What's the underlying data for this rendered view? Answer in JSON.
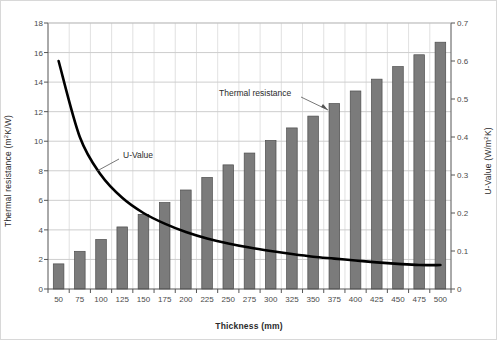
{
  "chart_data": {
    "type": "bar",
    "title": "",
    "subtitle": "",
    "xlabel": "Thickness (mm)",
    "ylabel": "Thermal resistance (m²K/W)",
    "y2label": "U-Value (W/m²K)",
    "categories": [
      "50",
      "75",
      "100",
      "125",
      "150",
      "175",
      "200",
      "225",
      "250",
      "275",
      "300",
      "325",
      "350",
      "375",
      "400",
      "425",
      "450",
      "475",
      "500"
    ],
    "ylim": [
      0,
      18
    ],
    "yticks": [
      "0",
      "2",
      "4",
      "6",
      "8",
      "10",
      "12",
      "14",
      "16",
      "18"
    ],
    "y2lim": [
      0,
      0.7
    ],
    "y2ticks": [
      "0",
      "0.1",
      "0.2",
      "0.3",
      "0.4",
      "0.5",
      "0.6",
      "0.7"
    ],
    "grid": true,
    "legend_position": "inline-annotations",
    "series": [
      {
        "name": "Thermal resistance",
        "type": "bar",
        "axis": "left",
        "unit": "m²K/W",
        "color": "#7b7b7b",
        "values": [
          1.7,
          2.55,
          3.35,
          4.2,
          5.05,
          5.85,
          6.7,
          7.55,
          8.4,
          9.2,
          10.05,
          10.9,
          11.7,
          12.55,
          13.4,
          14.2,
          15.05,
          15.85,
          16.7
        ]
      },
      {
        "name": "U-Value",
        "type": "line",
        "axis": "right",
        "unit": "W/m²K",
        "color": "#000000",
        "values": [
          0.6,
          0.4,
          0.3,
          0.24,
          0.2,
          0.172,
          0.15,
          0.133,
          0.12,
          0.109,
          0.1,
          0.092,
          0.085,
          0.08,
          0.075,
          0.07,
          0.066,
          0.063,
          0.063
        ]
      }
    ],
    "annotations": [
      {
        "text": "Thermal resistance",
        "x_px": 218,
        "y_px": 93
      },
      {
        "text": "U-Value",
        "x_px": 122,
        "y_px": 155
      }
    ]
  }
}
